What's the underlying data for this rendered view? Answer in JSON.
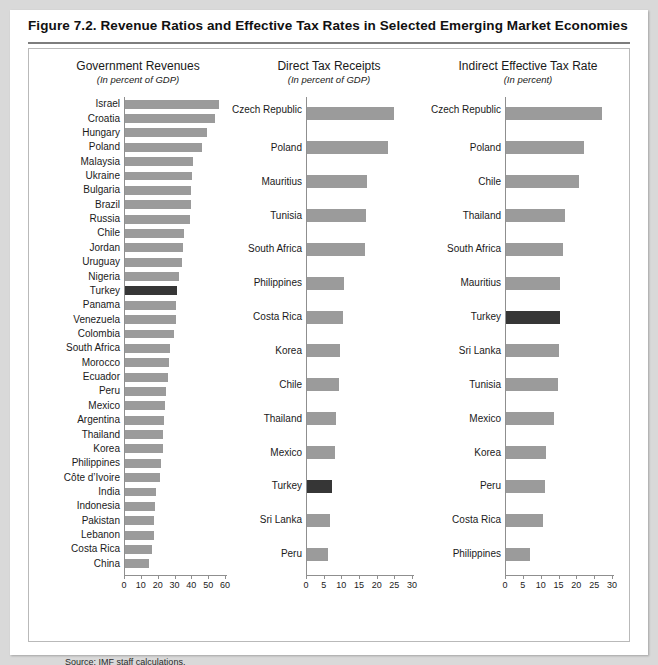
{
  "figure": {
    "title": "Figure 7.2.  Revenue Ratios and Effective Tax Rates in Selected Emerging Market Economies",
    "source": "Source: IMF staff calculations.",
    "bar_color": "#9b9b9b",
    "highlight_color": "#363636",
    "highlight_country": "Turkey"
  },
  "chart_data": [
    {
      "type": "bar",
      "orientation": "horizontal",
      "title": "Government Revenues",
      "subtitle": "(In percent of GDP)",
      "xlabel": "",
      "ylabel": "",
      "xlim": [
        0,
        60
      ],
      "xticks": [
        0,
        10,
        20,
        30,
        40,
        50,
        60
      ],
      "grid": false,
      "legend": "none",
      "categories": [
        "Israel",
        "Croatia",
        "Hungary",
        "Poland",
        "Malaysia",
        "Ukraine",
        "Bulgaria",
        "Brazil",
        "Russia",
        "Chile",
        "Jordan",
        "Uruguay",
        "Nigeria",
        "Turkey",
        "Panama",
        "Venezuela",
        "Colombia",
        "South Africa",
        "Morocco",
        "Ecuador",
        "Peru",
        "Mexico",
        "Argentina",
        "Thailand",
        "Korea",
        "Philippines",
        "Côte d’Ivoire",
        "India",
        "Indonesia",
        "Pakistan",
        "Lebanon",
        "Costa Rica",
        "China"
      ],
      "values": [
        56.0,
        53.5,
        49.0,
        46.0,
        40.5,
        40.0,
        39.5,
        39.0,
        38.5,
        35.0,
        34.5,
        34.0,
        32.0,
        31.0,
        30.5,
        30.0,
        29.0,
        26.5,
        26.0,
        25.5,
        24.5,
        23.5,
        23.0,
        22.5,
        22.5,
        21.5,
        21.0,
        18.5,
        18.0,
        17.5,
        17.0,
        16.0,
        14.5
      ]
    },
    {
      "type": "bar",
      "orientation": "horizontal",
      "title": "Direct Tax Receipts",
      "subtitle": "(In percent of GDP)",
      "xlabel": "",
      "ylabel": "",
      "xlim": [
        0,
        30
      ],
      "xticks": [
        0,
        5,
        10,
        15,
        20,
        25,
        30
      ],
      "grid": false,
      "legend": "none",
      "categories": [
        "Czech Republic",
        "Poland",
        "Mauritius",
        "Tunisia",
        "South Africa",
        "Philippines",
        "Costa Rica",
        "Korea",
        "Chile",
        "Thailand",
        "Mexico",
        "Turkey",
        "Sri Lanka",
        "Peru"
      ],
      "values": [
        24.5,
        23.0,
        17.0,
        16.8,
        16.3,
        10.5,
        10.3,
        9.2,
        9.0,
        8.2,
        8.0,
        7.0,
        6.4,
        6.0
      ]
    },
    {
      "type": "bar",
      "orientation": "horizontal",
      "title": "Indirect Effective Tax Rate",
      "subtitle": "(In percent)",
      "xlabel": "",
      "ylabel": "",
      "xlim": [
        0,
        30
      ],
      "xticks": [
        0,
        5,
        10,
        15,
        20,
        25,
        30
      ],
      "grid": false,
      "legend": "none",
      "categories": [
        "Czech Republic",
        "Poland",
        "Chile",
        "Thailand",
        "South Africa",
        "Mauritius",
        "Turkey",
        "Sri Lanka",
        "Tunisia",
        "Mexico",
        "Korea",
        "Peru",
        "Costa Rica",
        "Philippines"
      ],
      "values": [
        27.0,
        22.0,
        20.5,
        16.5,
        16.0,
        15.2,
        15.0,
        14.8,
        14.5,
        13.5,
        11.3,
        11.0,
        10.3,
        6.8
      ]
    }
  ]
}
